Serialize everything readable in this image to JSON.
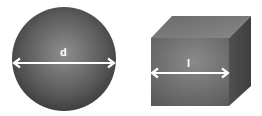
{
  "diagram": {
    "shapes": [
      {
        "type": "sphere",
        "label": "d",
        "measure": "diameter",
        "fill_center": "#8a8a8a",
        "fill_edge": "#3c3c3c"
      },
      {
        "type": "cube",
        "label": "l",
        "measure": "edge length",
        "front_face": "#6e6e6e",
        "top_face": "#7c7c7c",
        "side_face": "#4e4e4e"
      }
    ],
    "arrow_color": "#ffffff"
  }
}
